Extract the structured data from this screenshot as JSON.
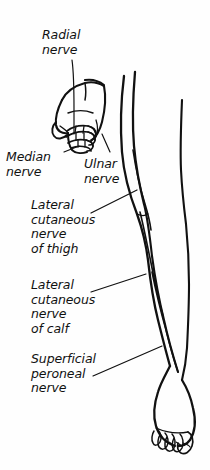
{
  "figure": {
    "background_color": "#fefefe",
    "ink_color": "#111111",
    "labels": {
      "radial_nerve": "Radial\nnerve",
      "median_nerve": "Median\nnerve",
      "ulnar_nerve": "Ulnar\nnerve",
      "lateral_cutaneous_nerve_of_thigh": "Lateral\ncutaneous\nnerve\nof thigh",
      "lateral_cutaneous_nerve_of_calf": "Lateral\ncutaneous\nnerve\nof calf",
      "superficial_peroneal_nerve": "Superficial\nperoneal\nnerve"
    },
    "illustrations": {
      "hand": "hand-illustration",
      "leg": "leg-illustration",
      "foot": "foot-illustration"
    }
  }
}
